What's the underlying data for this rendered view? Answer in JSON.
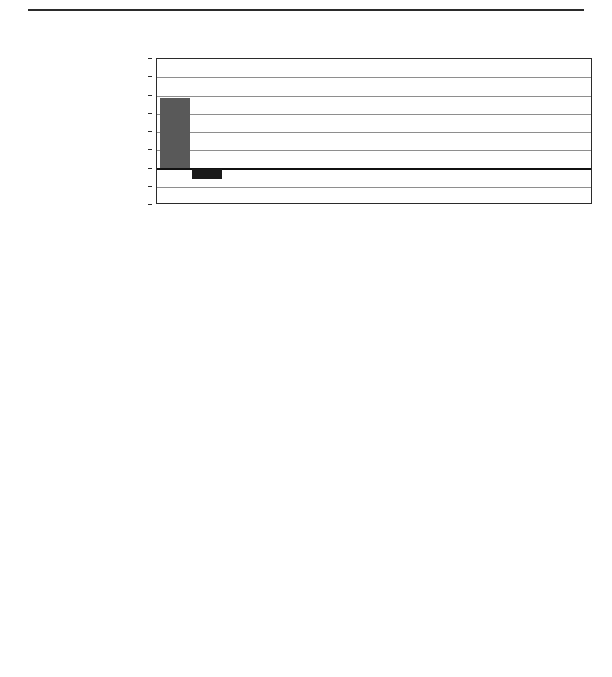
{
  "page": {
    "top_rule": true
  },
  "axis": {
    "unit_label": "Per  cent",
    "ticks": [
      60,
      50,
      40,
      30,
      20,
      10,
      0,
      -10,
      -20
    ],
    "ymin": -20,
    "ymax": 60
  },
  "colors": {
    "series_mid_gray": "#595959",
    "series_light_gray": "#d2d2d2",
    "education_black": "#1a1a1a",
    "gridline": "#8e8e8e",
    "axis": "#2b2b2b"
  },
  "charts": [
    {
      "id": "A",
      "letter": "A.",
      "title": "Prose literacy scale",
      "legend": [
        {
          "label": "Prose literacy",
          "color": "#595959"
        },
        {
          "label": "Education",
          "color": "#1a1a1a"
        }
      ],
      "categories": [
        "Italy",
        "Bermuda",
        "Norway",
        "Canada",
        "United States",
        "Switzerland"
      ],
      "series": [
        {
          "name": "Prose literacy",
          "color": "#595959",
          "values": [
            38.5,
            21,
            12.5,
            7.5,
            6,
            0
          ]
        },
        {
          "name": "Education",
          "color": "#1a1a1a",
          "values": [
            -5.5,
            0,
            2.5,
            6,
            8,
            8
          ]
        }
      ]
    },
    {
      "id": "B",
      "letter": "B.",
      "title": "Document literacy scale",
      "legend": [
        {
          "label": "Document literacy",
          "color": "#595959"
        },
        {
          "label": "Education",
          "color": "#1a1a1a"
        }
      ],
      "categories": [
        "Italy",
        "Bermuda",
        "Norway",
        "Canada",
        "United States",
        "Switzerland"
      ],
      "series": [
        {
          "name": "Document literacy",
          "color": "#595959",
          "values": [
            56,
            42,
            13,
            10,
            5.5,
            0
          ]
        },
        {
          "name": "Education",
          "color": "#1a1a1a",
          "values": [
            0,
            -10.5,
            2,
            4.5,
            8,
            7.5
          ]
        }
      ]
    },
    {
      "id": "C",
      "letter": "C.",
      "title": "Numeracy scale",
      "legend": [
        {
          "label": "Numeracy",
          "color": "#d2d2d2"
        },
        {
          "label": "Education",
          "color": "#1a1a1a"
        }
      ],
      "categories": [
        "Bermuda",
        "Italy",
        "Norway",
        "Canada",
        "United States",
        "Switzerland"
      ],
      "series": [
        {
          "name": "Numeracy",
          "color": "#d2d2d2",
          "values": [
            29,
            15.5,
            14.5,
            10.5,
            8,
            0
          ]
        },
        {
          "name": "Education",
          "color": "#1a1a1a",
          "values": [
            -5,
            0,
            0,
            4,
            6,
            8
          ]
        }
      ]
    }
  ],
  "chart_data": {
    "type": "bar",
    "xlabel": "",
    "ylabel": "Per cent",
    "ylim": [
      -20,
      60
    ],
    "yticks": [
      -20,
      -10,
      0,
      10,
      20,
      30,
      40,
      50,
      60
    ],
    "grid": true,
    "legend_position": "left-outside",
    "panels": [
      {
        "panel": "A",
        "title": "A.  Prose literacy scale",
        "categories": [
          "Italy",
          "Bermuda",
          "Norway",
          "Canada",
          "United States",
          "Switzerland"
        ],
        "series": [
          {
            "name": "Prose literacy",
            "values": [
              38.5,
              21,
              12.5,
              7.5,
              6,
              0
            ]
          },
          {
            "name": "Education",
            "values": [
              -5.5,
              0,
              2.5,
              6,
              8,
              8
            ]
          }
        ]
      },
      {
        "panel": "B",
        "title": "B.  Document literacy scale",
        "categories": [
          "Italy",
          "Bermuda",
          "Norway",
          "Canada",
          "United States",
          "Switzerland"
        ],
        "series": [
          {
            "name": "Document literacy",
            "values": [
              56,
              42,
              13,
              10,
              5.5,
              0
            ]
          },
          {
            "name": "Education",
            "values": [
              0,
              -10.5,
              2,
              4.5,
              8,
              7.5
            ]
          }
        ]
      },
      {
        "panel": "C",
        "title": "C.  Numeracy scale",
        "categories": [
          "Bermuda",
          "Italy",
          "Norway",
          "Canada",
          "United States",
          "Switzerland"
        ],
        "series": [
          {
            "name": "Numeracy",
            "values": [
              29,
              15.5,
              14.5,
              10.5,
              8,
              0
            ]
          },
          {
            "name": "Education",
            "values": [
              -5,
              0,
              0,
              4,
              6,
              8
            ]
          }
        ]
      }
    ]
  }
}
